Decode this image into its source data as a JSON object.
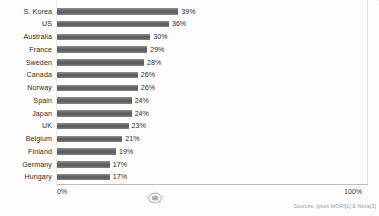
{
  "chart_data": {
    "type": "bar",
    "orientation": "horizontal",
    "title": "",
    "xlabel": "",
    "ylabel": "",
    "xlim": [
      0,
      100
    ],
    "grid": false,
    "legend": null,
    "categories": [
      "S. Korea",
      "US",
      "Australia",
      "France",
      "Sweden",
      "Canada",
      "Norway",
      "Spain",
      "Japan",
      "UK",
      "Belgium",
      "Finland",
      "Germany",
      "Hungary"
    ],
    "values": [
      39,
      36,
      30,
      29,
      28,
      26,
      26,
      24,
      24,
      23,
      21,
      19,
      17,
      17
    ],
    "value_labels": [
      "39%",
      "36%",
      "30%",
      "29%",
      "28%",
      "26%",
      "26%",
      "24%",
      "24%",
      "23%",
      "21%",
      "19%",
      "17%",
      "17%"
    ],
    "axis_ticks": [
      "0%",
      "100%"
    ],
    "bar_color": "#636363",
    "text_color": "#2b2b2b"
  },
  "footer": {
    "source": "Sources: Ipsos MORI[1] & Nova[1]"
  },
  "watermark": {
    "name": "oval-stamp-watermark"
  }
}
